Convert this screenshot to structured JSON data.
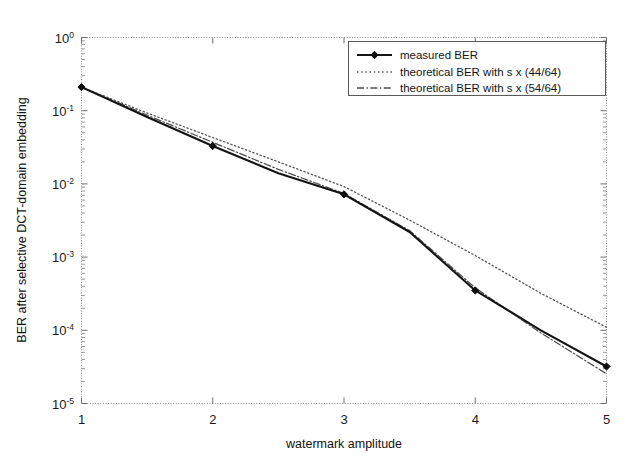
{
  "chart_data": {
    "type": "line",
    "title": "",
    "xlabel": "watermark amplitude",
    "ylabel": "BER after selective DCT-domain embedding",
    "xlim": [
      1,
      5
    ],
    "ylim": [
      1e-05,
      1
    ],
    "yscale": "log",
    "xscale": "linear",
    "grid": false,
    "legend_position": "top-right",
    "xticks": [
      "1",
      "2",
      "3",
      "4",
      "5"
    ],
    "xtick_values": [
      1,
      2,
      3,
      4,
      5
    ],
    "yticks": [
      "10^0",
      "10^-1",
      "10^-2",
      "10^-3",
      "10^-4",
      "10^-5"
    ],
    "ytick_values": [
      1,
      0.1,
      0.01,
      0.001,
      0.0001,
      1e-05
    ],
    "ytick_mantissa": "10",
    "ytick_exponents": [
      "0",
      "-1",
      "-2",
      "-3",
      "-4",
      "-5"
    ],
    "x": [
      1,
      1.5,
      2,
      2.5,
      3,
      3.5,
      4,
      4.5,
      5
    ],
    "series": [
      {
        "name": "measured BER",
        "style": "solid",
        "marker": "diamond",
        "color": "#141414",
        "values": [
          0.21,
          0.082,
          0.033,
          0.014,
          0.0072,
          0.0022,
          0.00035,
          0.0001,
          3.2e-05
        ]
      },
      {
        "name": "theoretical BER with s x (44/64)",
        "style": "dotted",
        "marker": "none",
        "color": "#4d4d4d",
        "values": [
          0.21,
          0.093,
          0.043,
          0.02,
          0.0092,
          0.0032,
          0.00105,
          0.00032,
          0.00011
        ]
      },
      {
        "name": "theoretical BER with s x (54/64)",
        "style": "dashdot",
        "marker": "none",
        "color": "#4d4d4d",
        "values": [
          0.21,
          0.087,
          0.037,
          0.0158,
          0.0074,
          0.0023,
          0.00038,
          9.2e-05,
          2.55e-05
        ]
      }
    ]
  },
  "legend": {
    "entries": [
      {
        "label": "measured BER",
        "style": "solid-marker"
      },
      {
        "label": "theoretical BER with s x (44/64)",
        "style": "dotted"
      },
      {
        "label": "theoretical BER with s x (54/64)",
        "style": "dashdot"
      }
    ]
  },
  "axes": {
    "x_title": "watermark amplitude",
    "y_title": "BER after selective DCT-domain embedding",
    "x_tick_labels": [
      "1",
      "2",
      "3",
      "4",
      "5"
    ],
    "y_tick_base": "10",
    "y_tick_exponents": [
      "0",
      "-1",
      "-2",
      "-3",
      "-4",
      "-5"
    ]
  }
}
